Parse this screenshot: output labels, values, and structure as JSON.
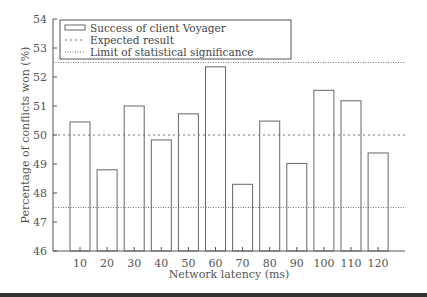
{
  "chart_data": {
    "type": "bar",
    "title": "",
    "xlabel": "Network latency (ms)",
    "ylabel": "Percentage of conflicts won (%)",
    "categories": [
      "10",
      "20",
      "30",
      "40",
      "50",
      "60",
      "70",
      "80",
      "90",
      "100",
      "110",
      "120"
    ],
    "series": [
      {
        "name": "Success of client Voyager",
        "values": [
          50.45,
          48.8,
          51.0,
          49.83,
          50.73,
          52.35,
          48.3,
          50.48,
          49.02,
          51.54,
          51.18,
          49.38
        ]
      }
    ],
    "reference_lines": [
      {
        "name": "Expected result",
        "value": 50.0,
        "style": "dotted"
      },
      {
        "name": "Limit of statistical significance",
        "value": 52.5,
        "style": "dotted"
      },
      {
        "name": "Limit of statistical significance",
        "value": 47.5,
        "style": "dotted"
      }
    ],
    "ylim": [
      46,
      54
    ],
    "yticks": [
      46,
      47,
      48,
      49,
      50,
      51,
      52,
      53,
      54
    ],
    "grid": false,
    "legend_position": "upper left"
  },
  "legend": {
    "items": [
      {
        "label": "Success of client Voyager",
        "symbol": "box"
      },
      {
        "label": "Expected result",
        "symbol": "dotted"
      },
      {
        "label": "Limit of statistical significance",
        "symbol": "dotted-fine"
      }
    ]
  },
  "colors": {
    "axis": "#555555",
    "bar_stroke": "#666666",
    "ref_line": "#777777",
    "bottom_bar": "#333333"
  }
}
